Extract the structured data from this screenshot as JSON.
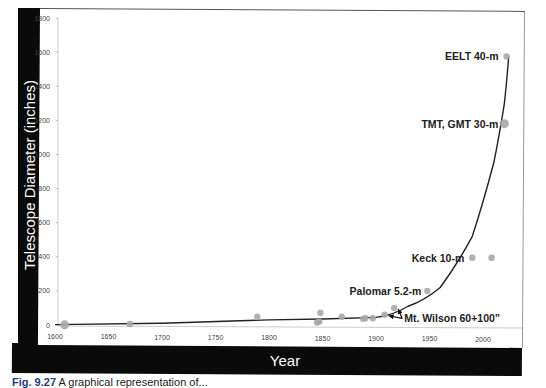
{
  "chart_data": {
    "type": "scatter",
    "title": "",
    "xlabel": "Year",
    "ylabel": "Telescope Diameter (inches)",
    "xlim": [
      1600,
      2030
    ],
    "ylim": [
      0,
      1800
    ],
    "x_ticks": [
      1600,
      1650,
      1700,
      1750,
      1800,
      1850,
      1900,
      1950,
      2000
    ],
    "y_ticks": [
      0,
      200,
      400,
      600,
      800,
      1000,
      1200,
      1400,
      1600,
      1800
    ],
    "grid": false,
    "legend": null,
    "series": [
      {
        "name": "Telescopes",
        "marker": "circle",
        "color": "#a8a8a8",
        "x": [
          1609,
          1670,
          1789,
          1845,
          1847,
          1848,
          1868,
          1888,
          1890,
          1897,
          1908,
          1917,
          1948,
          1990,
          2008,
          2020,
          2022
        ],
        "y": [
          1,
          6,
          49,
          15,
          20,
          72,
          48,
          36,
          40,
          40,
          60,
          100,
          200,
          394,
          394,
          1181,
          1575
        ]
      }
    ],
    "trend_line": {
      "type": "exponential fit",
      "color": "#222222",
      "points": [
        [
          1600,
          2
        ],
        [
          1700,
          10
        ],
        [
          1800,
          30
        ],
        [
          1850,
          35
        ],
        [
          1900,
          45
        ],
        [
          1930,
          110
        ],
        [
          1960,
          220
        ],
        [
          1990,
          520
        ],
        [
          2010,
          950
        ],
        [
          2020,
          1300
        ],
        [
          2024,
          1575
        ]
      ]
    },
    "annotations": [
      {
        "text": "EELT 40-m",
        "x": 2022,
        "y": 1575
      },
      {
        "text": "TMT, GMT 30-m",
        "x": 2020,
        "y": 1181
      },
      {
        "text": "Keck 10-m",
        "x": 1990,
        "y": 394
      },
      {
        "text": "Palomar 5.2-m",
        "x": 1948,
        "y": 200
      },
      {
        "text": "Mt. Wilson 60+100”",
        "x": 1917,
        "y": 100,
        "arrows_to": [
          [
            1908,
            60
          ],
          [
            1917,
            100
          ]
        ]
      }
    ]
  },
  "caption": {
    "label": "Fig. 9.27",
    "text": "A graphical representation of..."
  }
}
